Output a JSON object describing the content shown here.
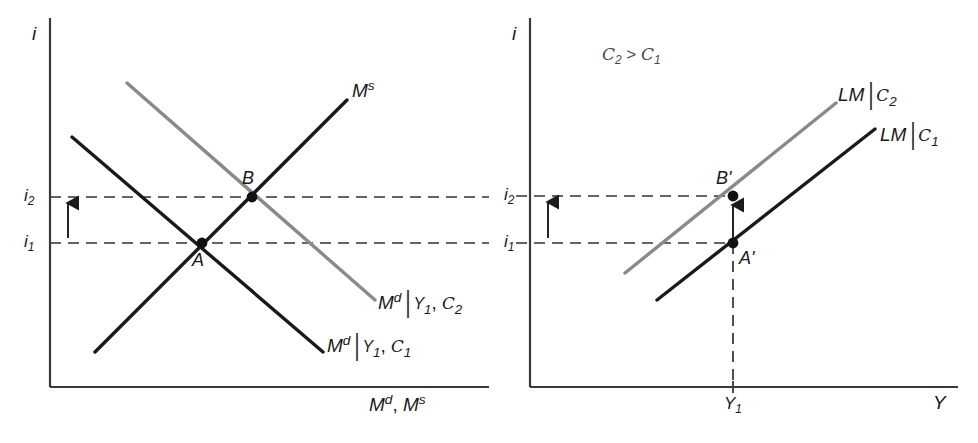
{
  "figure": {
    "type": "economics-diagram",
    "background": "#ffffff",
    "colors": {
      "black_curve": "#1a1a1a",
      "gray_curve": "#8a8a8a",
      "axis": "#3a3a3a",
      "dashed": "#333333",
      "note_text": "#4a4a4a"
    }
  },
  "left_panel": {
    "name": "money-market",
    "y_axis_label": "i",
    "x_axis_label_parts": {
      "m1": "M",
      "sup1": "d",
      "sep": ", ",
      "m2": "M",
      "sup2": "s"
    },
    "x_axis_label": "M d, M s",
    "ticks": [
      {
        "id": "i2",
        "base": "i",
        "sub": "2",
        "y_px": 197
      },
      {
        "id": "i1",
        "base": "i",
        "sub": "1",
        "y_px": 243
      }
    ],
    "curves": [
      {
        "id": "Ms",
        "label_base": "M",
        "label_sup": "s",
        "color": "#1a1a1a",
        "slope": "upward",
        "x1": 95,
        "y1": 352,
        "x2": 347,
        "y2": 100
      },
      {
        "id": "Md_C1",
        "label_base": "M",
        "label_sup": "d",
        "label_cond": "Y",
        "label_cond_sub": "1",
        "label_param": "C",
        "label_param_sub": "1",
        "color": "#1a1a1a",
        "slope": "downward",
        "x1": 72,
        "y1": 137,
        "x2": 323,
        "y2": 352
      },
      {
        "id": "Md_C2",
        "label_base": "M",
        "label_sup": "d",
        "label_cond": "Y",
        "label_cond_sub": "1",
        "label_param": "C",
        "label_param_sub": "2",
        "color": "#8a8a8a",
        "slope": "downward",
        "x1": 127,
        "y1": 83,
        "x2": 375,
        "y2": 300
      }
    ],
    "points": [
      {
        "id": "A",
        "label": "A",
        "x_px": 202,
        "y_px": 243
      },
      {
        "id": "B",
        "label": "B",
        "x_px": 252,
        "y_px": 197
      }
    ],
    "arrow": {
      "id": "rate-rise-arrow",
      "x_px": 68,
      "from_y": 238,
      "to_y": 203
    },
    "dashed_lines": [
      {
        "id": "i2-guide",
        "y_px": 197,
        "x1": 50,
        "x2": 489
      },
      {
        "id": "i1-guide",
        "y_px": 243,
        "x1": 50,
        "x2": 489
      }
    ],
    "axis": {
      "x0": 50,
      "y0": 387,
      "x_end": 489,
      "y_top": 18
    }
  },
  "right_panel": {
    "name": "lm-curves",
    "y_axis_label": "i",
    "x_axis_label": "Y",
    "note": {
      "left": "C",
      "left_sub": "2",
      "op": " > ",
      "right": "C",
      "right_sub": "1",
      "text": "C2 > C1"
    },
    "ticks": [
      {
        "id": "i2",
        "base": "i",
        "sub": "2",
        "y_px": 196
      },
      {
        "id": "i1",
        "base": "i",
        "sub": "1",
        "y_px": 243
      }
    ],
    "x_ticks": [
      {
        "id": "Y1",
        "base": "Y",
        "sub": "1",
        "x_px": 733
      }
    ],
    "curves": [
      {
        "id": "LM_C2",
        "label_base": "LM",
        "label_param": "C",
        "label_param_sub": "2",
        "color": "#8a8a8a",
        "slope": "upward",
        "x1": 625,
        "y1": 273,
        "x2": 836,
        "y2": 103
      },
      {
        "id": "LM_C1",
        "label_base": "LM",
        "label_param": "C",
        "label_param_sub": "1",
        "color": "#1a1a1a",
        "slope": "upward",
        "x1": 657,
        "y1": 300,
        "x2": 875,
        "y2": 129
      }
    ],
    "points": [
      {
        "id": "Aprime",
        "label": "A'",
        "x_px": 733,
        "y_px": 243
      },
      {
        "id": "Bprime",
        "label": "B'",
        "x_px": 733,
        "y_px": 196
      }
    ],
    "arrows": [
      {
        "id": "rate-rise-arrow-axis",
        "x_px": 548,
        "from_y": 238,
        "to_y": 202
      },
      {
        "id": "shift-arrow",
        "x_px": 733,
        "from_y": 238,
        "to_y": 205
      }
    ],
    "dashed_lines": [
      {
        "id": "i2-guide",
        "y_px": 196,
        "x1": 516,
        "x2": 733
      },
      {
        "id": "i1-guide",
        "y_px": 243,
        "x1": 516,
        "x2": 733
      },
      {
        "id": "Y1-guide",
        "x_px": 733,
        "y1": 243,
        "y2": 387
      }
    ],
    "axis": {
      "x0": 530,
      "y0": 387,
      "x_end": 958,
      "y_top": 18
    }
  }
}
